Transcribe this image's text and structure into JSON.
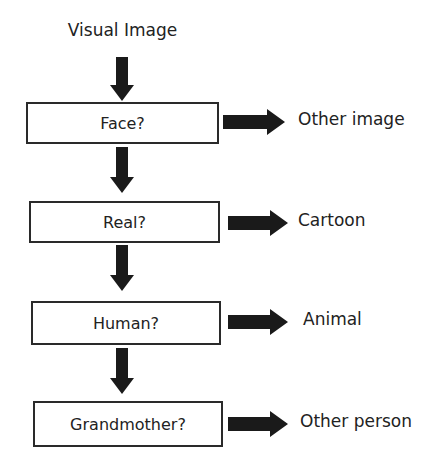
{
  "diagram": {
    "start": "Visual Image",
    "steps": [
      {
        "question": "Face?",
        "no_outcome": "Other image"
      },
      {
        "question": "Real?",
        "no_outcome": "Cartoon"
      },
      {
        "question": "Human?",
        "no_outcome": "Animal"
      },
      {
        "question": "Grandmother?",
        "no_outcome": "Other person"
      }
    ]
  },
  "colors": {
    "arrow": "#1a1a1a",
    "border": "#2a2a2a"
  }
}
